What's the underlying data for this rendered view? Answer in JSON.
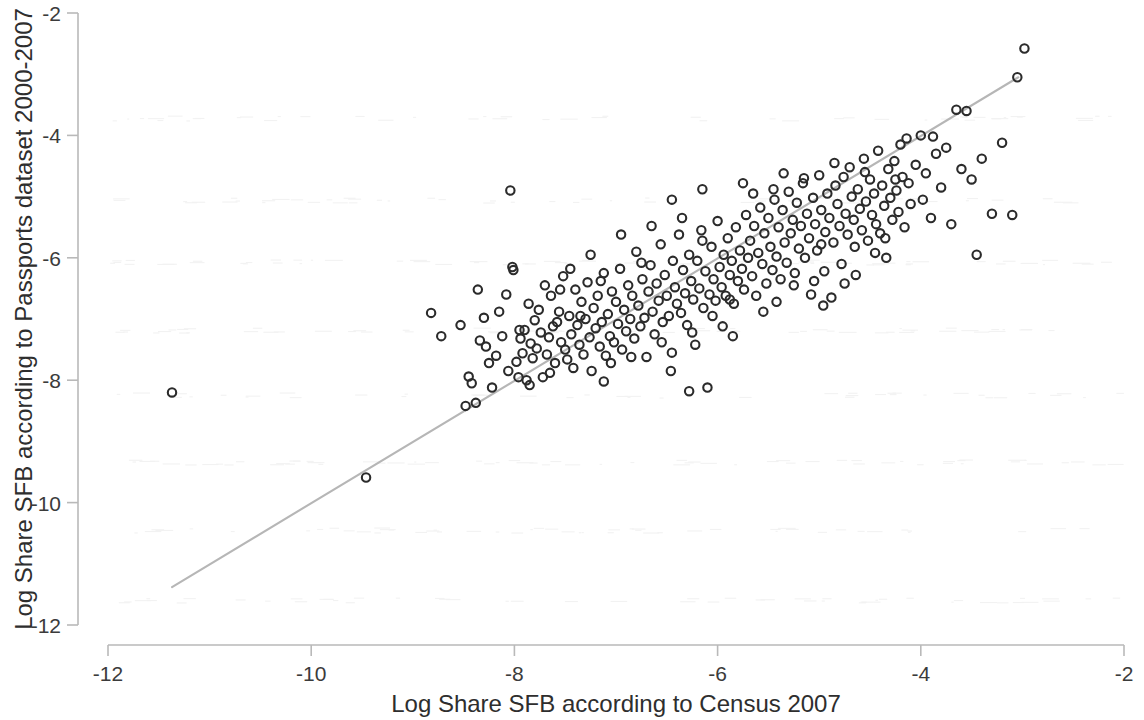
{
  "figure": {
    "background_color": "#ffffff",
    "marker_color": "#2b2b2b",
    "line_color": "#b6b6b6",
    "axis_color": "#b9b9b9"
  },
  "axes": {
    "x_title": "Log Share SFB according to Census 2007",
    "y_title": "Log Share SFB according to Passports dataset 2000-2007",
    "x_ticks": [
      "-12",
      "-10",
      "-8",
      "-6",
      "-4",
      "-2"
    ],
    "y_ticks": [
      "-2",
      "-4",
      "-6",
      "-8",
      "-10",
      "-12"
    ]
  },
  "chart_data": {
    "type": "scatter",
    "title": "",
    "xlabel": "Log Share SFB according to Census 2007",
    "ylabel": "Log Share SFB according to Passports dataset 2000-2007",
    "xlim": [
      -12,
      -2
    ],
    "ylim": [
      -12,
      -2
    ],
    "xticks": [
      -12,
      -10,
      -8,
      -6,
      -4,
      -2
    ],
    "yticks": [
      -12,
      -10,
      -8,
      -6,
      -4,
      -2
    ],
    "grid": false,
    "legend": null,
    "marker": "open-circle",
    "fit_line": {
      "label": "linear fit",
      "x": [
        -11.37,
        -3.04
      ],
      "y": [
        -11.38,
        -3.05
      ],
      "slope": 1.0,
      "intercept": 0.0
    },
    "series": [
      {
        "name": "countries",
        "n_points": 281,
        "points": [
          [
            -11.37,
            -8.2
          ],
          [
            -9.46,
            -9.59
          ],
          [
            -8.82,
            -6.9
          ],
          [
            -8.72,
            -7.28
          ],
          [
            -8.53,
            -7.1
          ],
          [
            -8.45,
            -7.94
          ],
          [
            -8.42,
            -8.05
          ],
          [
            -8.38,
            -8.37
          ],
          [
            -8.34,
            -7.35
          ],
          [
            -8.3,
            -6.98
          ],
          [
            -8.28,
            -7.45
          ],
          [
            -8.22,
            -8.12
          ],
          [
            -8.18,
            -7.6
          ],
          [
            -8.12,
            -7.28
          ],
          [
            -8.08,
            -6.6
          ],
          [
            -8.06,
            -7.85
          ],
          [
            -8.04,
            -4.9
          ],
          [
            -8.02,
            -6.15
          ],
          [
            -8.01,
            -6.2
          ],
          [
            -7.98,
            -7.7
          ],
          [
            -7.96,
            -7.95
          ],
          [
            -7.94,
            -7.32
          ],
          [
            -7.92,
            -7.56
          ],
          [
            -7.9,
            -7.18
          ],
          [
            -7.88,
            -8.0
          ],
          [
            -7.86,
            -6.75
          ],
          [
            -7.84,
            -7.4
          ],
          [
            -7.82,
            -7.64
          ],
          [
            -7.8,
            -7.02
          ],
          [
            -7.78,
            -7.48
          ],
          [
            -7.76,
            -6.85
          ],
          [
            -7.74,
            -7.22
          ],
          [
            -7.72,
            -7.95
          ],
          [
            -7.7,
            -6.45
          ],
          [
            -7.68,
            -7.58
          ],
          [
            -7.66,
            -7.3
          ],
          [
            -7.64,
            -6.62
          ],
          [
            -7.62,
            -7.12
          ],
          [
            -7.6,
            -7.72
          ],
          [
            -7.58,
            -7.05
          ],
          [
            -7.56,
            -6.88
          ],
          [
            -7.54,
            -7.38
          ],
          [
            -7.52,
            -6.3
          ],
          [
            -7.5,
            -7.5
          ],
          [
            -7.48,
            -7.66
          ],
          [
            -7.46,
            -6.95
          ],
          [
            -7.44,
            -7.25
          ],
          [
            -7.42,
            -7.8
          ],
          [
            -7.4,
            -6.52
          ],
          [
            -7.38,
            -7.1
          ],
          [
            -7.36,
            -7.42
          ],
          [
            -7.34,
            -6.72
          ],
          [
            -7.32,
            -7.58
          ],
          [
            -7.3,
            -7.0
          ],
          [
            -7.28,
            -6.4
          ],
          [
            -7.26,
            -7.3
          ],
          [
            -7.24,
            -7.85
          ],
          [
            -7.22,
            -6.82
          ],
          [
            -7.2,
            -7.15
          ],
          [
            -7.18,
            -6.62
          ],
          [
            -7.16,
            -7.45
          ],
          [
            -7.14,
            -7.05
          ],
          [
            -7.12,
            -6.25
          ],
          [
            -7.1,
            -7.6
          ],
          [
            -7.08,
            -6.92
          ],
          [
            -7.06,
            -7.28
          ],
          [
            -7.04,
            -6.55
          ],
          [
            -7.02,
            -7.38
          ],
          [
            -7.0,
            -6.72
          ],
          [
            -6.98,
            -7.08
          ],
          [
            -6.96,
            -6.18
          ],
          [
            -6.94,
            -7.5
          ],
          [
            -6.92,
            -6.85
          ],
          [
            -6.9,
            -7.2
          ],
          [
            -6.88,
            -6.45
          ],
          [
            -6.86,
            -7.0
          ],
          [
            -6.84,
            -6.62
          ],
          [
            -6.82,
            -7.32
          ],
          [
            -6.8,
            -5.9
          ],
          [
            -6.78,
            -6.78
          ],
          [
            -6.76,
            -7.12
          ],
          [
            -6.74,
            -6.35
          ],
          [
            -6.72,
            -6.98
          ],
          [
            -6.7,
            -7.62
          ],
          [
            -6.68,
            -6.55
          ],
          [
            -6.66,
            -6.12
          ],
          [
            -6.64,
            -6.88
          ],
          [
            -6.62,
            -7.25
          ],
          [
            -6.6,
            -6.42
          ],
          [
            -6.58,
            -6.7
          ],
          [
            -6.56,
            -5.78
          ],
          [
            -6.54,
            -7.05
          ],
          [
            -6.52,
            -6.28
          ],
          [
            -6.5,
            -6.62
          ],
          [
            -6.48,
            -6.95
          ],
          [
            -6.46,
            -7.85
          ],
          [
            -6.44,
            -6.05
          ],
          [
            -6.42,
            -6.48
          ],
          [
            -6.4,
            -6.75
          ],
          [
            -6.38,
            -5.62
          ],
          [
            -6.36,
            -6.9
          ],
          [
            -6.34,
            -6.2
          ],
          [
            -6.32,
            -6.58
          ],
          [
            -6.3,
            -7.1
          ],
          [
            -6.28,
            -5.95
          ],
          [
            -6.26,
            -6.38
          ],
          [
            -6.24,
            -6.68
          ],
          [
            -6.22,
            -7.42
          ],
          [
            -6.2,
            -6.05
          ],
          [
            -6.18,
            -6.5
          ],
          [
            -6.16,
            -5.55
          ],
          [
            -6.14,
            -6.82
          ],
          [
            -6.12,
            -6.22
          ],
          [
            -6.1,
            -8.12
          ],
          [
            -6.08,
            -6.6
          ],
          [
            -6.06,
            -5.82
          ],
          [
            -6.04,
            -6.35
          ],
          [
            -6.02,
            -6.7
          ],
          [
            -6.0,
            -5.4
          ],
          [
            -5.98,
            -6.15
          ],
          [
            -5.96,
            -6.48
          ],
          [
            -5.94,
            -5.95
          ],
          [
            -5.92,
            -6.62
          ],
          [
            -5.9,
            -5.68
          ],
          [
            -5.88,
            -6.28
          ],
          [
            -5.86,
            -6.05
          ],
          [
            -5.84,
            -6.75
          ],
          [
            -5.82,
            -5.5
          ],
          [
            -5.8,
            -6.38
          ],
          [
            -5.78,
            -5.88
          ],
          [
            -5.76,
            -6.18
          ],
          [
            -5.74,
            -6.52
          ],
          [
            -5.72,
            -5.3
          ],
          [
            -5.7,
            -6.0
          ],
          [
            -5.68,
            -5.72
          ],
          [
            -5.66,
            -6.3
          ],
          [
            -5.64,
            -5.48
          ],
          [
            -5.62,
            -6.62
          ],
          [
            -5.6,
            -5.92
          ],
          [
            -5.58,
            -5.18
          ],
          [
            -5.56,
            -6.1
          ],
          [
            -5.54,
            -5.6
          ],
          [
            -5.52,
            -6.42
          ],
          [
            -5.5,
            -5.35
          ],
          [
            -5.48,
            -5.82
          ],
          [
            -5.46,
            -6.2
          ],
          [
            -5.44,
            -5.05
          ],
          [
            -5.42,
            -5.98
          ],
          [
            -5.4,
            -5.5
          ],
          [
            -5.38,
            -6.35
          ],
          [
            -5.36,
            -5.22
          ],
          [
            -5.34,
            -5.75
          ],
          [
            -5.32,
            -6.08
          ],
          [
            -5.3,
            -4.92
          ],
          [
            -5.28,
            -5.6
          ],
          [
            -5.26,
            -5.38
          ],
          [
            -5.24,
            -6.25
          ],
          [
            -5.22,
            -5.1
          ],
          [
            -5.2,
            -5.85
          ],
          [
            -5.18,
            -5.48
          ],
          [
            -5.16,
            -4.78
          ],
          [
            -5.14,
            -6.0
          ],
          [
            -5.12,
            -5.28
          ],
          [
            -5.1,
            -5.68
          ],
          [
            -5.08,
            -6.6
          ],
          [
            -5.06,
            -5.02
          ],
          [
            -5.04,
            -5.45
          ],
          [
            -5.02,
            -5.88
          ],
          [
            -5.0,
            -4.65
          ],
          [
            -4.98,
            -5.22
          ],
          [
            -4.96,
            -6.78
          ],
          [
            -4.94,
            -5.58
          ],
          [
            -4.92,
            -4.95
          ],
          [
            -4.9,
            -5.35
          ],
          [
            -4.88,
            -6.65
          ],
          [
            -4.86,
            -5.75
          ],
          [
            -4.84,
            -4.82
          ],
          [
            -4.82,
            -5.12
          ],
          [
            -4.8,
            -5.48
          ],
          [
            -4.78,
            -6.1
          ],
          [
            -4.76,
            -4.68
          ],
          [
            -4.74,
            -5.28
          ],
          [
            -4.72,
            -5.62
          ],
          [
            -4.7,
            -4.52
          ],
          [
            -4.68,
            -5.0
          ],
          [
            -4.66,
            -5.38
          ],
          [
            -4.64,
            -6.28
          ],
          [
            -4.62,
            -4.88
          ],
          [
            -4.6,
            -5.2
          ],
          [
            -4.58,
            -5.55
          ],
          [
            -4.56,
            -4.38
          ],
          [
            -4.54,
            -5.08
          ],
          [
            -4.52,
            -5.72
          ],
          [
            -4.5,
            -4.72
          ],
          [
            -4.48,
            -5.3
          ],
          [
            -4.46,
            -4.95
          ],
          [
            -4.44,
            -5.45
          ],
          [
            -4.42,
            -4.25
          ],
          [
            -4.4,
            -5.6
          ],
          [
            -4.38,
            -4.82
          ],
          [
            -4.36,
            -5.15
          ],
          [
            -4.34,
            -6.0
          ],
          [
            -4.32,
            -4.55
          ],
          [
            -4.3,
            -5.02
          ],
          [
            -4.28,
            -5.38
          ],
          [
            -4.26,
            -4.42
          ],
          [
            -4.24,
            -4.9
          ],
          [
            -4.22,
            -5.25
          ],
          [
            -4.2,
            -4.15
          ],
          [
            -4.18,
            -4.68
          ],
          [
            -4.16,
            -5.5
          ],
          [
            -4.14,
            -4.05
          ],
          [
            -4.12,
            -4.78
          ],
          [
            -4.1,
            -5.12
          ],
          [
            -4.05,
            -4.48
          ],
          [
            -4.0,
            -4.0
          ],
          [
            -3.95,
            -4.62
          ],
          [
            -3.9,
            -5.35
          ],
          [
            -3.85,
            -4.3
          ],
          [
            -3.8,
            -4.85
          ],
          [
            -3.75,
            -4.2
          ],
          [
            -3.7,
            -5.45
          ],
          [
            -3.65,
            -3.58
          ],
          [
            -3.6,
            -4.55
          ],
          [
            -3.55,
            -3.6
          ],
          [
            -3.5,
            -4.72
          ],
          [
            -3.45,
            -5.95
          ],
          [
            -3.4,
            -4.38
          ],
          [
            -3.3,
            -5.28
          ],
          [
            -3.2,
            -4.12
          ],
          [
            -3.1,
            -5.3
          ],
          [
            -3.05,
            -3.05
          ],
          [
            -2.98,
            -2.58
          ],
          [
            -7.95,
            -7.18
          ],
          [
            -7.65,
            -7.88
          ],
          [
            -7.35,
            -6.95
          ],
          [
            -7.05,
            -7.72
          ],
          [
            -6.75,
            -6.08
          ],
          [
            -6.45,
            -7.55
          ],
          [
            -6.15,
            -5.72
          ],
          [
            -5.85,
            -7.28
          ],
          [
            -5.55,
            -6.88
          ],
          [
            -5.25,
            -6.45
          ],
          [
            -4.95,
            -6.22
          ],
          [
            -4.65,
            -5.82
          ],
          [
            -4.35,
            -5.68
          ],
          [
            -6.05,
            -6.95
          ],
          [
            -5.95,
            -7.12
          ],
          [
            -6.25,
            -7.22
          ],
          [
            -6.55,
            -7.38
          ],
          [
            -6.85,
            -7.62
          ],
          [
            -7.15,
            -6.38
          ],
          [
            -7.45,
            -6.18
          ],
          [
            -8.15,
            -6.88
          ],
          [
            -8.25,
            -7.72
          ],
          [
            -6.35,
            -5.35
          ],
          [
            -6.65,
            -5.48
          ],
          [
            -6.95,
            -5.62
          ],
          [
            -5.45,
            -4.88
          ],
          [
            -5.15,
            -4.7
          ],
          [
            -4.85,
            -4.45
          ],
          [
            -4.55,
            -4.6
          ],
          [
            -4.25,
            -4.72
          ],
          [
            -5.65,
            -4.95
          ],
          [
            -5.35,
            -4.62
          ],
          [
            -6.45,
            -5.05
          ],
          [
            -6.15,
            -4.88
          ],
          [
            -5.75,
            -4.78
          ],
          [
            -7.25,
            -5.95
          ],
          [
            -7.55,
            -6.52
          ],
          [
            -5.05,
            -6.38
          ],
          [
            -4.75,
            -6.42
          ],
          [
            -4.45,
            -5.92
          ],
          [
            -3.98,
            -5.05
          ],
          [
            -3.88,
            -4.02
          ],
          [
            -7.85,
            -8.08
          ],
          [
            -7.12,
            -8.02
          ],
          [
            -6.28,
            -8.18
          ],
          [
            -8.48,
            -8.42
          ],
          [
            -8.36,
            -6.52
          ],
          [
            -5.88,
            -6.68
          ],
          [
            -5.42,
            -6.72
          ],
          [
            -4.98,
            -5.78
          ]
        ]
      }
    ]
  }
}
